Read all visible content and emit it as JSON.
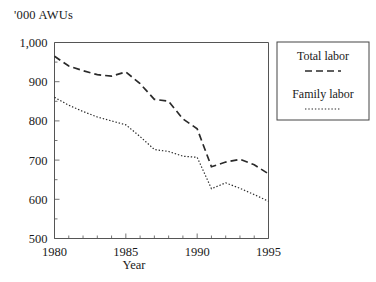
{
  "chart_data": {
    "type": "line",
    "title": "",
    "ylabel": "'000 AWUs",
    "xlabel": "Year",
    "x": [
      1980,
      1981,
      1982,
      1983,
      1984,
      1985,
      1986,
      1987,
      1988,
      1989,
      1990,
      1991,
      1992,
      1993,
      1994,
      1995
    ],
    "xlim": [
      1980,
      1995
    ],
    "ylim": [
      500,
      1000
    ],
    "xticks": [
      1980,
      1985,
      1990,
      1995
    ],
    "xtick_labels": [
      "1980",
      "1985",
      "1990",
      "1995"
    ],
    "yticks": [
      500,
      600,
      700,
      800,
      900,
      1000
    ],
    "ytick_labels": [
      "500",
      "600",
      "700",
      "800",
      "900",
      "1,000"
    ],
    "minor_xticks_every": 1,
    "minor_yticks_every": 50,
    "grid": false,
    "legend_position": "outside-right-top",
    "series": [
      {
        "name": "Total labor",
        "style": "dashed",
        "values": [
          965,
          940,
          928,
          918,
          914,
          925,
          895,
          855,
          850,
          805,
          780,
          683,
          695,
          702,
          688,
          665
        ]
      },
      {
        "name": "Family labor",
        "style": "dotted",
        "values": [
          860,
          840,
          824,
          810,
          800,
          790,
          760,
          727,
          722,
          710,
          707,
          627,
          642,
          628,
          612,
          595
        ]
      }
    ]
  },
  "legend": {
    "entries": [
      {
        "label": "Total labor",
        "style": "dashed"
      },
      {
        "label": "Family labor",
        "style": "dotted"
      }
    ]
  }
}
